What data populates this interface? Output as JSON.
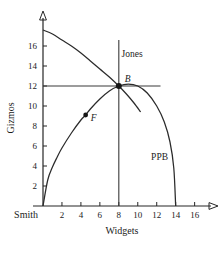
{
  "chart_data": {
    "type": "line",
    "title": "",
    "xlabel": "Widgets",
    "ylabel": "Gizmos",
    "xlim": [
      0,
      17.2
    ],
    "ylim": [
      0,
      18.6
    ],
    "grid": false,
    "legend_position": "inline-annotations",
    "xticks": [
      2,
      4,
      6,
      8,
      10,
      12,
      14,
      16
    ],
    "yticks": [
      2,
      4,
      6,
      8,
      10,
      12,
      14,
      16
    ],
    "xtick_labels": [
      "2",
      "4",
      "6",
      "8",
      "10",
      "12",
      "14",
      "16"
    ],
    "ytick_labels": [
      "2",
      "4",
      "6",
      "8",
      "10",
      "12",
      "14",
      "16"
    ],
    "origin_label": "Smith",
    "series": [
      {
        "name": "PPB",
        "label": "PPB",
        "label_x": 12.3,
        "label_y": 4.6,
        "description": "Production possibility boundary, concave curve from origin through B to x-intercept 14",
        "points": [
          [
            0.0,
            0.0
          ],
          [
            0.5,
            2.6
          ],
          [
            1.0,
            3.9
          ],
          [
            1.5,
            4.9
          ],
          [
            2.0,
            5.8
          ],
          [
            3.0,
            7.3
          ],
          [
            4.0,
            8.6
          ],
          [
            4.5,
            9.1
          ],
          [
            5.0,
            9.7
          ],
          [
            6.0,
            10.7
          ],
          [
            7.0,
            11.5
          ],
          [
            8.0,
            12.0
          ],
          [
            9.0,
            12.2
          ],
          [
            10.0,
            12.0
          ],
          [
            11.0,
            11.3
          ],
          [
            12.0,
            10.0
          ],
          [
            12.8,
            8.4
          ],
          [
            13.4,
            6.4
          ],
          [
            13.8,
            3.8
          ],
          [
            14.0,
            0.0
          ]
        ]
      },
      {
        "name": "Jones",
        "label": "Jones",
        "label_x": 9.4,
        "label_y": 14.9,
        "description": "Jones indifference curve, downward sloping concave curve from y-axis through B",
        "points": [
          [
            0.0,
            17.6
          ],
          [
            1.0,
            17.2
          ],
          [
            2.0,
            16.6
          ],
          [
            3.0,
            16.0
          ],
          [
            4.0,
            15.3
          ],
          [
            5.0,
            14.5
          ],
          [
            6.0,
            13.7
          ],
          [
            7.0,
            12.9
          ],
          [
            8.0,
            12.0
          ],
          [
            8.8,
            11.2
          ],
          [
            9.6,
            10.3
          ],
          [
            10.3,
            9.4
          ]
        ]
      }
    ],
    "guides": [
      {
        "name": "smith-budget-vertical",
        "type": "vertical",
        "value": 8,
        "from": 0,
        "to": 16.6
      },
      {
        "name": "smith-budget-horizontal",
        "type": "horizontal",
        "value": 12,
        "from": 0,
        "to": 12.4
      }
    ],
    "annotations": [
      {
        "name": "point-b",
        "label": "B",
        "x": 8,
        "y": 12,
        "marker": "filled-dot",
        "label_dx": 6,
        "label_dy": -4
      },
      {
        "name": "point-f",
        "label": "F",
        "x": 4.5,
        "y": 9.1,
        "marker": "filled-dot",
        "label_dx": 5,
        "label_dy": 6
      }
    ],
    "colors": {
      "axis": "#262626",
      "curve": "#2b2b2b",
      "guide": "#3a3a3a",
      "marker": "#161616",
      "background": "#ffffff",
      "text": "#1c1c1c"
    }
  }
}
